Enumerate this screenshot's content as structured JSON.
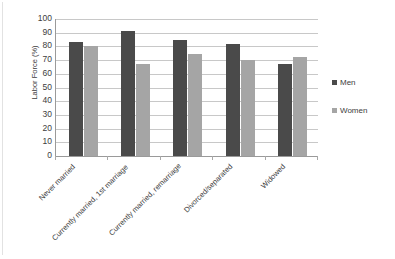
{
  "chart_data": {
    "type": "bar",
    "title": "",
    "xlabel": "",
    "ylabel": "Labor Force (%)",
    "ylim": [
      0,
      100
    ],
    "yticks": [
      0,
      10,
      20,
      30,
      40,
      50,
      60,
      70,
      80,
      90,
      100
    ],
    "ytick_labels": [
      "0",
      "10",
      "20",
      "30",
      "40",
      "50",
      "60",
      "70",
      "80",
      "90",
      "100"
    ],
    "grid": true,
    "legend_position": "right",
    "categories": [
      "Never married",
      "Currently married, 1st marriage",
      "Currently married, remarriage",
      "Divorced/separated",
      "Widowed"
    ],
    "series": [
      {
        "name": "Men",
        "color": "#4a4a4a",
        "values": [
          83,
          91.5,
          85,
          81.5,
          67.5
        ]
      },
      {
        "name": "Women",
        "color": "#a5a5a5",
        "values": [
          80.5,
          67.5,
          74.5,
          70,
          72
        ]
      }
    ]
  },
  "legend": {
    "men_label": "Men",
    "women_label": "Women"
  },
  "axis": {
    "y_title": "Labor Force (%)"
  }
}
